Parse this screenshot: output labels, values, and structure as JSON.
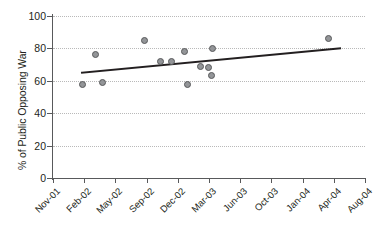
{
  "chart_data": {
    "type": "scatter",
    "title": "",
    "subtitle": "",
    "xlabel": "",
    "ylabel": "% of Public Opposing War",
    "xlim": [
      0,
      10
    ],
    "ylim": [
      0,
      100
    ],
    "grid": true,
    "legend": "none",
    "y_ticks": [
      0,
      20,
      40,
      60,
      80,
      100
    ],
    "y_tick_labels": [
      "0",
      "20",
      "40",
      "60",
      "80",
      "100"
    ],
    "x_tick_labels": [
      "Nov-01",
      "Feb-02",
      "May-02",
      "Sep-02",
      "Dec-02",
      "Mar-03",
      "Jun-03",
      "Oct-03",
      "Jan-04",
      "Apr-04",
      "Aug-04"
    ],
    "series": [
      {
        "name": "Public opposing war",
        "marker": "circle",
        "marker_fill": "#939598",
        "marker_edge": "#58595b",
        "points": [
          {
            "x": 0.95,
            "y": 58
          },
          {
            "x": 1.35,
            "y": 76
          },
          {
            "x": 1.58,
            "y": 59
          },
          {
            "x": 2.94,
            "y": 85
          },
          {
            "x": 3.43,
            "y": 72
          },
          {
            "x": 3.8,
            "y": 72
          },
          {
            "x": 4.22,
            "y": 78
          },
          {
            "x": 4.3,
            "y": 58
          },
          {
            "x": 4.72,
            "y": 69
          },
          {
            "x": 4.97,
            "y": 68
          },
          {
            "x": 5.12,
            "y": 80
          },
          {
            "x": 5.08,
            "y": 63
          },
          {
            "x": 8.82,
            "y": 86
          }
        ]
      }
    ],
    "trendline": {
      "name": "linear fit",
      "color": "#231f20",
      "x_start": 0.93,
      "y_start": 65,
      "x_end": 9.2,
      "y_end": 80
    }
  }
}
